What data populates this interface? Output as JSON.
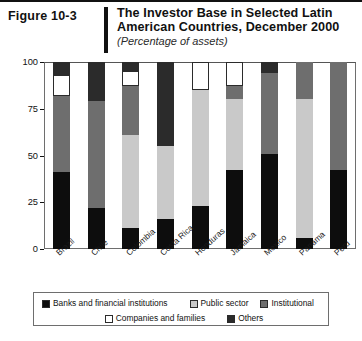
{
  "header": {
    "figure_number": "Figure 10-3",
    "title": "The Investor Base in Selected Latin American Countries, December 2000",
    "subtitle": "(Percentage of assets)"
  },
  "legend": {
    "items": [
      {
        "label": "Banks and financial institutions",
        "color": "#0d0d0d"
      },
      {
        "label": "Public sector",
        "color": "#c9c9c9"
      },
      {
        "label": "Institutional",
        "color": "#6e6e6e"
      },
      {
        "label": "Companies and families",
        "color": "#ffffff"
      },
      {
        "label": "Others",
        "color": "#2b2b2b"
      }
    ]
  },
  "chart_data": {
    "type": "bar",
    "subtype": "stacked-bar-100",
    "title": "The Investor Base in Selected Latin American Countries, December 2000",
    "subtitle": "(Percentage of assets)",
    "xlabel": "",
    "ylabel": "",
    "ylim": [
      0,
      100
    ],
    "yticks": [
      0,
      25,
      50,
      75,
      100
    ],
    "ytick_labels": [
      "0",
      "25",
      "50",
      "75",
      "100"
    ],
    "grid": false,
    "legend_position": "bottom",
    "categories": [
      "Brazil",
      "Chile",
      "Colombia",
      "Costa Rica",
      "Honduras",
      "Jamaica",
      "Mexico",
      "Panama",
      "Peru"
    ],
    "series": [
      {
        "name": "Banks and financial institutions",
        "color": "#0d0d0d",
        "values": [
          41,
          22,
          11,
          16,
          23,
          42,
          51,
          6,
          42
        ]
      },
      {
        "name": "Public sector",
        "color": "#c9c9c9",
        "values": [
          0,
          0,
          50,
          39,
          62,
          38,
          0,
          74,
          0
        ]
      },
      {
        "name": "Institutional",
        "color": "#6e6e6e",
        "values": [
          41,
          57,
          26,
          0,
          0,
          7,
          43,
          20,
          58
        ]
      },
      {
        "name": "Companies and families",
        "color": "#ffffff",
        "values": [
          11,
          0,
          8,
          0,
          15,
          13,
          0,
          0,
          0
        ]
      },
      {
        "name": "Others",
        "color": "#2b2b2b",
        "values": [
          7,
          21,
          5,
          45,
          0,
          0,
          6,
          0,
          0
        ]
      }
    ]
  }
}
